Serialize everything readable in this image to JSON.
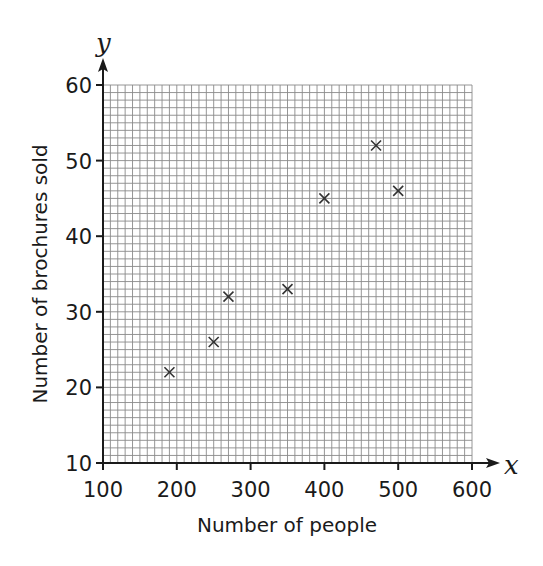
{
  "chart_data": {
    "type": "scatter",
    "title": "",
    "xlabel": "Number of people",
    "ylabel": "Number of brochures sold",
    "x_axis_var": "x",
    "y_axis_var": "y",
    "xlim": [
      100,
      600
    ],
    "ylim": [
      10,
      60
    ],
    "x_ticks": [
      100,
      200,
      300,
      400,
      500,
      600
    ],
    "y_ticks": [
      10,
      20,
      30,
      40,
      50,
      60
    ],
    "x_minor_step": 10,
    "y_minor_step": 1,
    "grid": true,
    "legend": null,
    "marker": "x",
    "points": [
      {
        "x": 190,
        "y": 22
      },
      {
        "x": 250,
        "y": 26
      },
      {
        "x": 270,
        "y": 32
      },
      {
        "x": 350,
        "y": 33
      },
      {
        "x": 400,
        "y": 45
      },
      {
        "x": 470,
        "y": 52
      },
      {
        "x": 500,
        "y": 46
      }
    ]
  },
  "colors": {
    "grid": "#8a8a8a",
    "axis": "#1a1a1a",
    "marker": "#333333"
  }
}
